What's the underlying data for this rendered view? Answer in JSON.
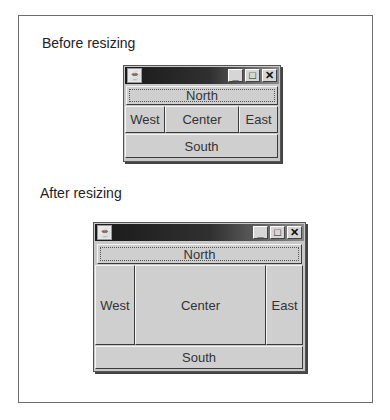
{
  "captions": {
    "before": "Before resizing",
    "after": "After resizing"
  },
  "window_before": {
    "icon": "java-coffee-cup-icon",
    "buttons": {
      "minimize": "_",
      "maximize": "□",
      "close": "✕"
    },
    "regions": {
      "north": "North",
      "west": "West",
      "center": "Center",
      "east": "East",
      "south": "South"
    }
  },
  "window_after": {
    "icon": "java-coffee-cup-icon",
    "buttons": {
      "minimize": "_",
      "maximize": "□",
      "close": "✕"
    },
    "regions": {
      "north": "North",
      "west": "West",
      "center": "Center",
      "east": "East",
      "south": "South"
    }
  }
}
